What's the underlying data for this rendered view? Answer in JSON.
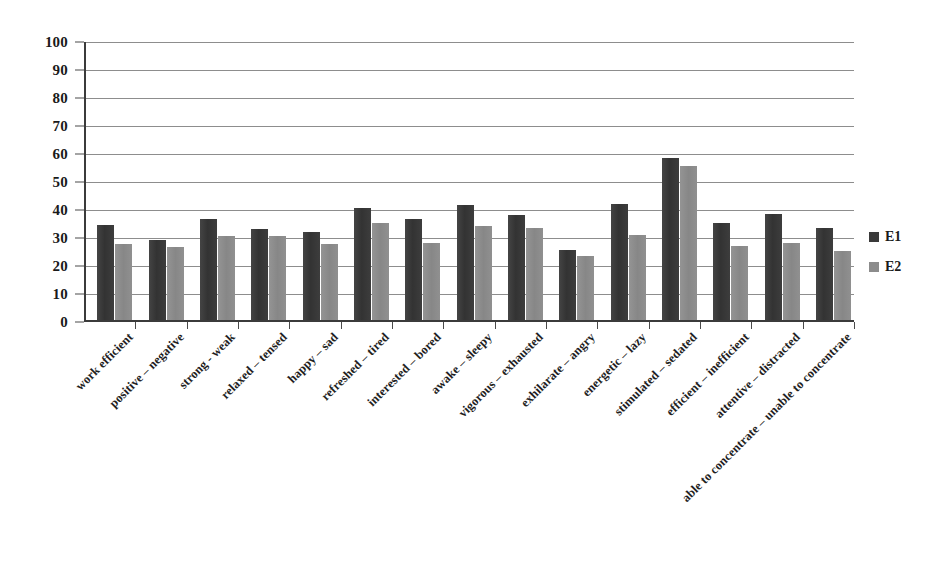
{
  "chart_data": {
    "type": "bar",
    "title": "",
    "subtitle": "",
    "xlabel": "",
    "ylabel": "",
    "ylim": [
      0,
      100
    ],
    "ytick_labels": [
      "100",
      "90",
      "80",
      "70",
      "60",
      "50",
      "40",
      "30",
      "20",
      "10",
      "0"
    ],
    "ytick_values": [
      100,
      90,
      80,
      70,
      60,
      50,
      40,
      30,
      20,
      10,
      0
    ],
    "grid": true,
    "grid_axis": "y",
    "legend_position": "right",
    "categories": [
      "work efficient",
      "positive – negative",
      "strong - weak",
      "relaxed – tensed",
      "happy – sad",
      "refreshed – tired",
      "interested – bored",
      "awake – sleepy",
      "vigorous – exhausted",
      "exhilarate – angry",
      "energetic – lazy",
      "stimulated – sedated",
      "efficient – inefficient",
      "attentive – distracted",
      "able to concentrate – unable to concentrate"
    ],
    "series": [
      {
        "name": "E1",
        "color": "#3a3a3a",
        "values": [
          34,
          28.5,
          36,
          32.5,
          31.5,
          40,
          36,
          41,
          37.5,
          25,
          41.5,
          58,
          34.5,
          38,
          33
        ]
      },
      {
        "name": "E2",
        "color": "#8c8c8c",
        "values": [
          27,
          26,
          30,
          30,
          27,
          34.5,
          27.5,
          33.5,
          33,
          23,
          30.5,
          55,
          26.5,
          27.5,
          24.5
        ]
      }
    ]
  },
  "legend": {
    "items": [
      {
        "label": "E1",
        "color": "#3a3a3a"
      },
      {
        "label": "E2",
        "color": "#8c8c8c"
      }
    ]
  }
}
